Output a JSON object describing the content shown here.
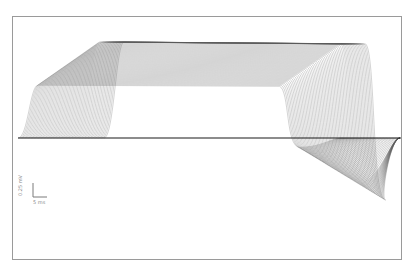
{
  "chart_data": {
    "type": "line",
    "title": "",
    "xlabel": "",
    "ylabel": "",
    "grid": false,
    "legend": null,
    "scale_bar": {
      "vertical_label": "0.25 mV",
      "horizontal_label": "5 ms"
    },
    "series": [
      {
        "name": "sweeps",
        "count": 60,
        "baseline_y_px": 138,
        "upper_envelope_peak_px": 42,
        "lower_envelope_trough_px": 200,
        "onset_x_px_first": 34,
        "onset_x_px_last": 120,
        "end_x_px_upper": 318,
        "end_x_px_lower": 370
      }
    ]
  },
  "colors": {
    "trace": "#5a5a5a",
    "baseline": "#1a1a1a",
    "frame": "#9a9a9a",
    "scale_bar": "#7a7a7a"
  }
}
